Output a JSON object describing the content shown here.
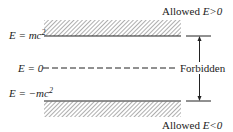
{
  "diagram": {
    "labels": {
      "allowed_positive": "Allowed",
      "allowed_positive_cond": "E>0",
      "top_level": "E = mc",
      "zero_level": "E = 0",
      "forbidden": "Forbidden",
      "bottom_level": "E = −mc",
      "allowed_negative": "Allowed",
      "allowed_negative_cond": "E<0",
      "superscript": "2"
    },
    "colors": {
      "ink": "#222222",
      "hatch": "#777777"
    }
  }
}
